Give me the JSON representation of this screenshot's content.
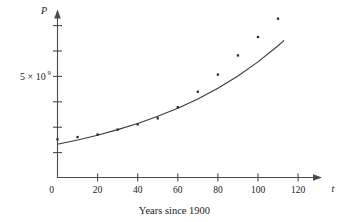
{
  "chart_data": {
    "type": "scatter",
    "title": "",
    "caption": "Years since 1900",
    "xlabel": "t",
    "ylabel": "P",
    "xlim": [
      0,
      128
    ],
    "ylim": [
      0,
      6900000000.0
    ],
    "grid": false,
    "legend": "none",
    "x_ticks": [
      0,
      20,
      40,
      60,
      80,
      100,
      120
    ],
    "x_tick_labels": [
      "0",
      "20",
      "40",
      "60",
      "80",
      "100",
      "120"
    ],
    "y_ticks": [
      1000000000,
      2000000000,
      3000000000,
      4000000000,
      5000000000,
      6000000000
    ],
    "y_tick_labels": [
      "",
      "",
      "",
      "",
      "5 × 10⁹",
      ""
    ],
    "y_axis_label_text": "5 × 10",
    "y_axis_label_exponent": "9",
    "y_axis_label_value": 5000000000,
    "points_label": "Population data (scatter)",
    "curve_label": "Exponential model curve",
    "x": [
      0,
      10,
      20,
      30,
      40,
      50,
      60,
      70,
      80,
      90,
      100,
      110
    ],
    "y": [
      1650000000,
      1750000000,
      1860000000,
      2070000000,
      2300000000,
      2560000000,
      3040000000,
      3710000000,
      4450000000,
      5280000000,
      6080000000,
      6870000000
    ],
    "series": [
      {
        "name": "Population data",
        "type": "scatter",
        "x": [
          0,
          10,
          20,
          30,
          40,
          50,
          60,
          70,
          80,
          90,
          100,
          110
        ],
        "values": [
          1650000000,
          1750000000,
          1860000000,
          2070000000,
          2300000000,
          2560000000,
          3040000000,
          3710000000,
          4450000000,
          5280000000,
          6080000000,
          6870000000
        ]
      },
      {
        "name": "Exponential model",
        "type": "line",
        "x": [
          0,
          10,
          20,
          30,
          40,
          50,
          60,
          70,
          80,
          90,
          100,
          110,
          113
        ],
        "values": [
          1440000000,
          1620000000,
          1830000000,
          2070000000,
          2340000000,
          2650000000,
          3000000000,
          3400000000,
          3860000000,
          4390000000,
          5000000000,
          5700000000,
          5930000000
        ]
      }
    ]
  },
  "figure": {
    "axis_arrow_x_name": "x-axis-arrow",
    "axis_arrow_y_name": "y-axis-arrow"
  }
}
